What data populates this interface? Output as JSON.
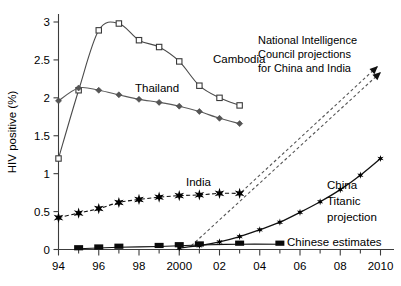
{
  "chart_data": {
    "type": "line",
    "title": "",
    "xlabel": "",
    "ylabel": "HIV positive (%)",
    "xlim": [
      1994,
      2010
    ],
    "ylim": [
      0,
      3.15
    ],
    "x_tick_labels": [
      "94",
      "96",
      "98",
      "2000",
      "02",
      "04",
      "06",
      "08",
      "2010"
    ],
    "x_tick_values": [
      1994,
      1996,
      1998,
      2000,
      2002,
      2004,
      2006,
      2008,
      2010
    ],
    "x_minor_step": 1,
    "y_tick_labels": [
      "0",
      "0.5",
      "1",
      "1.5",
      "2",
      "2.5",
      "3"
    ],
    "y_tick_values": [
      0,
      0.5,
      1,
      1.5,
      2,
      2.5,
      3
    ],
    "grid": false,
    "legend": "inline-labels",
    "series": [
      {
        "name": "Cambodia",
        "marker": "open-square",
        "label": "Cambodia",
        "x": [
          1994,
          1995,
          1996,
          1997,
          1998,
          1999,
          2000,
          2001,
          2002,
          2003
        ],
        "values": [
          1.2,
          2.1,
          2.89,
          2.98,
          2.76,
          2.67,
          2.48,
          2.16,
          2.0,
          1.9
        ]
      },
      {
        "name": "Thailand",
        "marker": "diamond",
        "label": "Thailand",
        "x": [
          1994,
          1995,
          1996,
          1997,
          1998,
          1999,
          2000,
          2001,
          2002,
          2003
        ],
        "values": [
          1.96,
          2.13,
          2.1,
          2.04,
          1.98,
          1.94,
          1.89,
          1.82,
          1.73,
          1.66
        ]
      },
      {
        "name": "India",
        "marker": "star",
        "label": "India",
        "x": [
          1994,
          1995,
          1996,
          1997,
          1998,
          1999,
          2000,
          2001,
          2002,
          2003
        ],
        "values": [
          0.42,
          0.48,
          0.54,
          0.62,
          0.66,
          0.69,
          0.71,
          0.72,
          0.74,
          0.74
        ]
      },
      {
        "name": "China Titanic projection",
        "marker": "star-small",
        "label": "China\nTitanic\nprojection",
        "x": [
          2000,
          2001,
          2002,
          2003,
          2004,
          2005,
          2006,
          2007,
          2008,
          2009,
          2010
        ],
        "values": [
          0.02,
          0.05,
          0.1,
          0.17,
          0.26,
          0.36,
          0.49,
          0.63,
          0.79,
          0.98,
          1.2
        ]
      },
      {
        "name": "Chinese estimates",
        "marker": "filled-square",
        "label": "Chinese estimates",
        "x": [
          1995,
          1996,
          1997,
          1999,
          2000,
          2001,
          2003,
          2005
        ],
        "values": [
          0.01,
          0.02,
          0.03,
          0.04,
          0.05,
          0.06,
          0.07,
          0.07
        ]
      }
    ],
    "annotations": [
      {
        "name": "nic-projection-note",
        "text_lines": [
          "National Intelligence",
          "Council projections",
          "for China and India"
        ],
        "arrows": 2,
        "style": "dashed-arrow"
      }
    ],
    "series_labels": {
      "cambodia": "Cambodia",
      "thailand": "Thailand",
      "india": "India",
      "china_line1": "China",
      "china_line2": "Titanic",
      "china_line3": "projection",
      "chinese_estimates": "Chinese estimates"
    },
    "colors": {
      "axis": "#3c3c3c",
      "cambodia": "#4a4a4a",
      "thailand": "#5a5a5a",
      "india": "#111111",
      "china": "#111111",
      "projection": "#555555",
      "background": "#ffffff"
    }
  }
}
